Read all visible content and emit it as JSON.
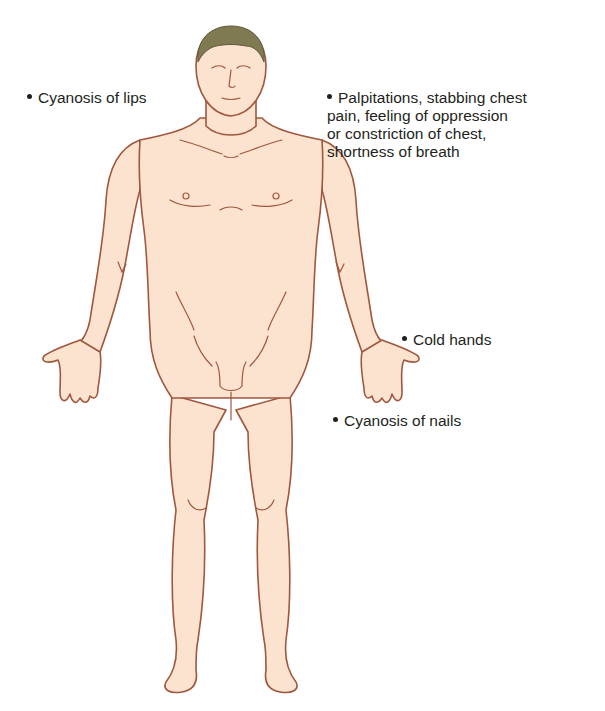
{
  "diagram": {
    "type": "anatomical-figure",
    "colors": {
      "skin": "#fbe3cf",
      "outline": "#a0573e",
      "hair": "#7f7a52",
      "text": "#231f20",
      "background": "#ffffff"
    },
    "labels": [
      {
        "id": "lips",
        "bullet": "•",
        "lines": [
          "Cyanosis of lips"
        ]
      },
      {
        "id": "chest",
        "bullet": "•",
        "lines": [
          "Palpitations, stabbing chest",
          "pain, feeling of oppression",
          "or constriction of chest,",
          "shortness of breath"
        ]
      },
      {
        "id": "hands",
        "bullet": "•",
        "lines": [
          "Cold hands"
        ]
      },
      {
        "id": "nails",
        "bullet": "•",
        "lines": [
          "Cyanosis of nails"
        ]
      }
    ]
  }
}
